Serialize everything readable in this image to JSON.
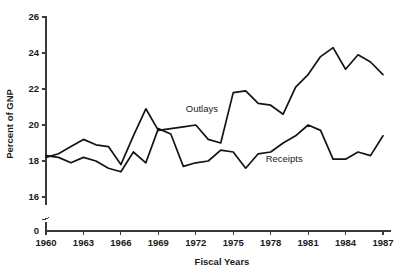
{
  "chart_data": {
    "type": "line",
    "title": "",
    "xlabel": "Fiscal Years",
    "ylabel": "Percent of GNP",
    "xlim": [
      1960,
      1987
    ],
    "ylim": [
      15.2,
      26
    ],
    "yticks": [
      16,
      18,
      20,
      22,
      24,
      26
    ],
    "ytick_labels": [
      "16",
      "18",
      "20",
      "22",
      "24",
      "26"
    ],
    "y_origin_label": "0",
    "y_axis_break": true,
    "xticks": [
      1960,
      1963,
      1966,
      1969,
      1972,
      1975,
      1978,
      1981,
      1984,
      1987
    ],
    "xtick_labels": [
      "1960",
      "1963",
      "1966",
      "1969",
      "1972",
      "1975",
      "1978",
      "1981",
      "1984",
      "1987"
    ],
    "grid": false,
    "legend_position": "inline-annotation",
    "x": [
      1960,
      1961,
      1962,
      1963,
      1964,
      1965,
      1966,
      1967,
      1968,
      1969,
      1970,
      1971,
      1972,
      1973,
      1974,
      1975,
      1976,
      1977,
      1978,
      1979,
      1980,
      1981,
      1982,
      1983,
      1984,
      1985,
      1986,
      1987
    ],
    "series": [
      {
        "name": "Outlays",
        "label_x": 1971.2,
        "label_y": 20.75,
        "values": [
          18.2,
          18.4,
          18.8,
          19.2,
          18.9,
          18.8,
          17.8,
          19.4,
          20.9,
          19.7,
          19.8,
          19.9,
          20.0,
          19.2,
          19.0,
          21.8,
          21.9,
          21.2,
          21.1,
          20.6,
          22.1,
          22.8,
          23.8,
          24.3,
          23.1,
          23.9,
          23.5,
          22.8
        ]
      },
      {
        "name": "Receipts",
        "label_x": 1977.6,
        "label_y": 17.95,
        "values": [
          18.3,
          18.2,
          17.9,
          18.2,
          18.0,
          17.6,
          17.4,
          18.5,
          17.9,
          19.8,
          19.5,
          17.7,
          17.9,
          18.0,
          18.6,
          18.5,
          17.6,
          18.4,
          18.5,
          19.0,
          19.4,
          20.0,
          19.7,
          18.1,
          18.1,
          18.5,
          18.3,
          19.4
        ]
      }
    ]
  }
}
